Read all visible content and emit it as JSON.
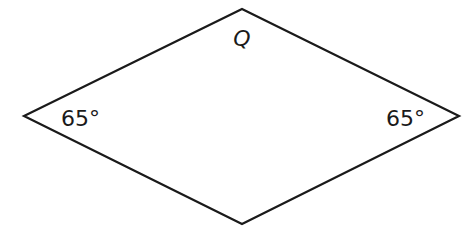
{
  "diagram": {
    "shape": "rhombus",
    "stroke_color": "#1a1a1a",
    "vertices": {
      "top": [
        242,
        9
      ],
      "right": [
        459,
        116
      ],
      "bottom": [
        242,
        224
      ],
      "left": [
        24,
        116
      ]
    },
    "labels": {
      "top_vertex": "Q",
      "left_angle": "65°",
      "right_angle": "65°"
    }
  }
}
